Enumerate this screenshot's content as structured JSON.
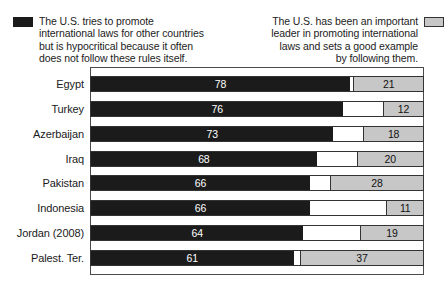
{
  "legend": {
    "left": {
      "text": "The U.S. tries to promote\ninternational laws for other countries\nbut is hypocritical because it often\ndoes not follow these rules itself.",
      "swatch_color": "#1b1b1b"
    },
    "right": {
      "text": "The U.S. has been an important\nleader in promoting international\nlaws and sets a good example\nby following them.",
      "swatch_color": "#c7c7c7"
    }
  },
  "chart_data": {
    "type": "bar",
    "orientation": "horizontal",
    "stacked": true,
    "categories": [
      "Egypt",
      "Turkey",
      "Azerbaijan",
      "Iraq",
      "Pakistan",
      "Indonesia",
      "Jordan (2008)",
      "Palest. Ter."
    ],
    "series": [
      {
        "name": "The U.S. tries to promote international laws for other countries but is hypocritical because it often does not follow these rules itself.",
        "color": "#1b1b1b",
        "text_color": "#ffffff",
        "align": "left",
        "values": [
          78,
          76,
          73,
          68,
          66,
          66,
          64,
          61
        ]
      },
      {
        "name": "The U.S. has been an important leader in promoting international laws and sets a good example by following them.",
        "color": "#c7c7c7",
        "text_color": "#111111",
        "align": "right",
        "values": [
          21,
          12,
          18,
          20,
          28,
          11,
          19,
          37
        ]
      }
    ],
    "xlim": [
      0,
      100
    ],
    "value_labels": "inside-center",
    "grid": false,
    "legend_position": "top",
    "frame_color": "#4a4a4a",
    "track_background": "#ffffff"
  }
}
